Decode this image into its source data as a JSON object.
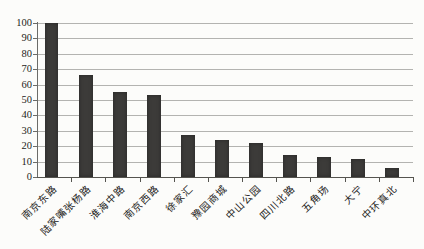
{
  "chart_data": {
    "type": "bar",
    "title": "",
    "categories": [
      "南京东路",
      "陆家嘴张杨路",
      "淮海中路",
      "南京西路",
      "徐家汇",
      "豫园商城",
      "中山公园",
      "四川北路",
      "五角场",
      "大宁",
      "中环真北"
    ],
    "values": [
      100,
      66,
      55,
      53,
      27,
      24,
      22,
      14,
      13,
      12,
      6
    ],
    "xlabel": "",
    "ylabel": "",
    "ylim": [
      0,
      100
    ],
    "ytick_step": 10,
    "ytick_labels": [
      "0",
      "10",
      "20",
      "30",
      "40",
      "50",
      "60",
      "70",
      "80",
      "90",
      "100"
    ],
    "grid": "horizontal-only",
    "legend": "none",
    "x_label_rotation_deg": 45,
    "colors": {
      "bar": "#3c3b39",
      "gridline": "#b3b3b0",
      "axis": "#55544f",
      "text": "#1d1c1a",
      "background": "#fcfcfa"
    }
  }
}
